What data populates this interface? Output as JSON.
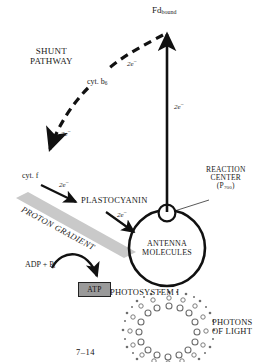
{
  "figure": {
    "caption": "7–14"
  },
  "labels": {
    "fd_bound_main": "Fd",
    "fd_bound_sub": "bound",
    "shunt_line1": "SHUNT",
    "shunt_line2": "PATHWAY",
    "cyt_b6_main": "cyt. b",
    "cyt_b6_sub": "6",
    "cyt_f": "cyt. f",
    "plastocyanin": "PLASTOCYANIN",
    "proton_gradient": "PROTON GRADIENT",
    "adp_main": "ADP + P",
    "adp_sub": "i",
    "atp": "ATP",
    "reaction_center_l1": "REACTION",
    "reaction_center_l2": "CENTER",
    "reaction_center_l3_open": "(P",
    "reaction_center_l3_sub": "700",
    "reaction_center_l3_close": ")",
    "antenna_l1": "ANTENNA",
    "antenna_l2": "MOLECULES",
    "photosystem": "PHOTOSYSTEM I",
    "photons_l1": "PHOTONS",
    "photons_l2": "OF LIGHT"
  },
  "electron_labels": {
    "shunt_upper": "2e",
    "shunt_lower": "2e",
    "cyt_f_to_pc": "2e",
    "pc_to_ps1": "2e",
    "ps1_to_fd": "2e",
    "charge": "−"
  },
  "colors": {
    "ink": "#111111",
    "gradient_band": "#c9c9c9",
    "atp_fill": "#9a9a9a",
    "photon_ring": "#7a7a7a",
    "background": "#ffffff"
  }
}
